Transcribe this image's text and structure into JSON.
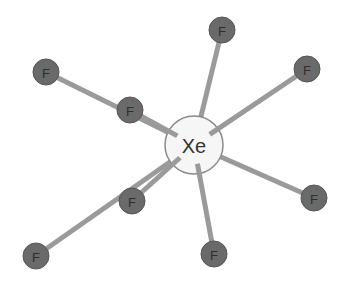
{
  "diagram": {
    "type": "molecular-structure",
    "molecule": "XeF8",
    "central_atom": {
      "label": "Xe",
      "x": 194,
      "y": 145,
      "r": 29,
      "fill": "#f6f6f6",
      "stroke": "#8a8a8a"
    },
    "ligand_style": {
      "fill": "#6a6a6a",
      "label_color": "#2e2e2e",
      "r": 13
    },
    "bond_color": "#9a9a9a",
    "ligands": [
      {
        "label": "F",
        "x": 46,
        "y": 72,
        "layer": "back"
      },
      {
        "label": "F",
        "x": 222,
        "y": 30,
        "layer": "back"
      },
      {
        "label": "F",
        "x": 314,
        "y": 198,
        "layer": "back"
      },
      {
        "label": "F",
        "x": 36,
        "y": 256,
        "layer": "back"
      },
      {
        "label": "F",
        "x": 130,
        "y": 110,
        "layer": "front"
      },
      {
        "label": "F",
        "x": 307,
        "y": 69,
        "layer": "front"
      },
      {
        "label": "F",
        "x": 214,
        "y": 254,
        "layer": "front"
      },
      {
        "label": "F",
        "x": 132,
        "y": 201,
        "layer": "front"
      }
    ]
  }
}
